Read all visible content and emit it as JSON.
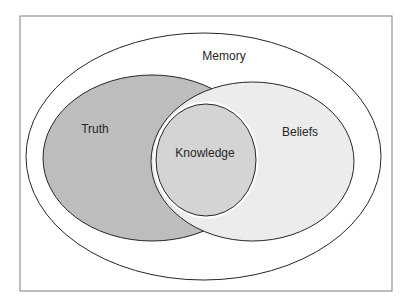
{
  "diagram": {
    "type": "nested-venn",
    "frame": {
      "x": 20,
      "y": 16,
      "width": 372,
      "height": 275,
      "stroke": "#7f7f7f"
    },
    "sets": [
      {
        "id": "memory",
        "label": "Memory",
        "shape": {
          "cx": 203.5,
          "cy": 156.5,
          "rx": 177.5,
          "ry": 123.5
        },
        "fill": "#ffffff",
        "stroke": "#262626",
        "label_pos": {
          "x": 224,
          "y": 60
        },
        "contains": [
          "truth",
          "beliefs"
        ]
      },
      {
        "id": "truth",
        "label": "Truth",
        "shape": {
          "cx": 152,
          "cy": 158,
          "rx": 109,
          "ry": 83
        },
        "fill": "#bdbdbd",
        "stroke": "#262626",
        "label_pos": {
          "x": 95,
          "y": 133
        }
      },
      {
        "id": "beliefs",
        "label": "Beliefs",
        "shape": {
          "cx": 252.5,
          "cy": 161.5,
          "rx": 101.5,
          "ry": 79.5
        },
        "fill": "#ececec",
        "stroke": "#262626",
        "label_pos": {
          "x": 300,
          "y": 136
        }
      },
      {
        "id": "knowledge",
        "label": "Knowledge",
        "shape": {
          "cx": 206,
          "cy": 160,
          "rx": 50,
          "ry": 56
        },
        "fill": "#d4d4d4",
        "stroke": "#262626",
        "label_pos": {
          "x": 205,
          "y": 157
        },
        "note": "intersection of truth and beliefs"
      }
    ]
  }
}
